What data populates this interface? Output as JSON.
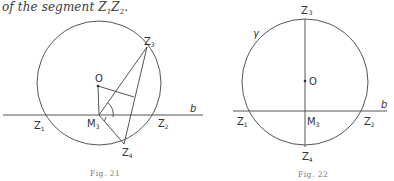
{
  "text": {
    "intro_prefix": "of the segment ",
    "intro_segment": "Z",
    "intro_sub1": "1",
    "intro_mid": "Z",
    "intro_sub2": "2",
    "intro_end": "."
  },
  "figures": [
    {
      "caption": "Fig. 21",
      "labels": {
        "z3": "Z",
        "z3_sub": "3",
        "o": "O",
        "b": "b",
        "z1": "Z",
        "z1_sub": "1",
        "m3": "M",
        "m3_sub": "3",
        "z2": "Z",
        "z2_sub": "2",
        "z4": "Z",
        "z4_sub": "4"
      }
    },
    {
      "caption": "Fig. 22",
      "labels": {
        "z3": "Z",
        "z3_sub": "3",
        "gamma": "γ",
        "o": "O",
        "b": "b",
        "z1": "Z",
        "z1_sub": "1",
        "m3": "M",
        "m3_sub": "3",
        "z2": "Z",
        "z2_sub": "2",
        "z4": "Z",
        "z4_sub": "4"
      }
    }
  ]
}
